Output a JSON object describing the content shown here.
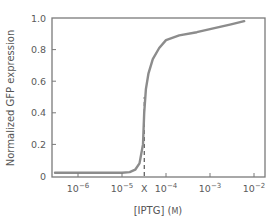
{
  "chart_data": {
    "type": "line",
    "title": "",
    "xlabel": "[IPTG] (M)",
    "ylabel": "Normalized GFP expression",
    "xscale": "log",
    "xlim": [
      3e-07,
      0.013
    ],
    "ylim": [
      0,
      1.0
    ],
    "grid": false,
    "legend": null,
    "x_ticks": [
      {
        "value": 1e-06,
        "label": "10",
        "exp": "-6"
      },
      {
        "value": 1e-05,
        "label": "10",
        "exp": "-5"
      },
      {
        "value": 3.2e-05,
        "label": "X",
        "exp": ""
      },
      {
        "value": 0.0001,
        "label": "10",
        "exp": "-4"
      },
      {
        "value": 0.001,
        "label": "10",
        "exp": "-3"
      },
      {
        "value": 0.01,
        "label": "10",
        "exp": "-2"
      }
    ],
    "y_ticks": [
      {
        "value": 0,
        "label": "0"
      },
      {
        "value": 0.2,
        "label": "0.2"
      },
      {
        "value": 0.4,
        "label": "0.4"
      },
      {
        "value": 0.6,
        "label": "0.6"
      },
      {
        "value": 0.8,
        "label": "0.8"
      },
      {
        "value": 1.0,
        "label": "1.0"
      }
    ],
    "series": [
      {
        "name": "GFP response",
        "color": "#8c8c8c",
        "x": [
          3e-07,
          1e-06,
          5e-06,
          1e-05,
          1.5e-05,
          2e-05,
          2.5e-05,
          3e-05,
          3.2e-05,
          3.5e-05,
          4e-05,
          5e-05,
          7e-05,
          0.0001,
          0.0002,
          0.0005,
          0.001,
          0.003,
          0.006
        ],
        "y": [
          0.02,
          0.02,
          0.02,
          0.02,
          0.025,
          0.04,
          0.08,
          0.2,
          0.4,
          0.55,
          0.65,
          0.74,
          0.81,
          0.86,
          0.89,
          0.91,
          0.93,
          0.96,
          0.98
        ]
      }
    ],
    "annotations": [
      {
        "type": "dashed-vline",
        "x": 3.2e-05,
        "y_from": 0,
        "y_to": 0.5,
        "label": "X",
        "color": "#333333"
      }
    ]
  }
}
